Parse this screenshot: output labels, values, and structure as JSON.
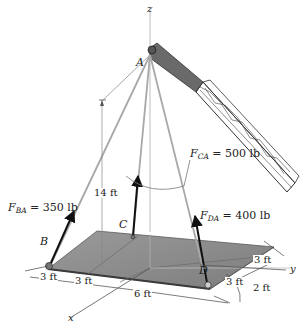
{
  "diagram": {
    "type": "3d-statics-force-diagram",
    "axes": {
      "x": "x",
      "y": "y",
      "z": "z"
    },
    "points": {
      "A": "A",
      "B": "B",
      "C": "C",
      "D": "D"
    },
    "forces": [
      {
        "symbol": "F",
        "subscript": "BA",
        "value": "= 350 lb",
        "from": "B",
        "to": "A"
      },
      {
        "symbol": "F",
        "subscript": "CA",
        "value": "= 500 lb",
        "from": "C",
        "to": "A"
      },
      {
        "symbol": "F",
        "subscript": "DA",
        "value": "= 400 lb",
        "from": "D",
        "to": "A"
      }
    ],
    "dimensions": {
      "height": "14 ft",
      "x_left": "3 ft",
      "x_right": "3 ft",
      "y_span": "6 ft",
      "d_upper": "3 ft",
      "d_lower": "3 ft",
      "d_offset": "2 ft"
    },
    "colors": {
      "plate": "#8c8c8c",
      "plate_edge": "#3a3a3a",
      "cable": "#a8a8a8",
      "arrow": "#111111",
      "boom": "#555555"
    }
  }
}
